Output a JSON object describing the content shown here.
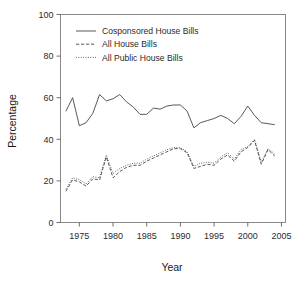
{
  "chart_data": {
    "type": "line",
    "title": "",
    "xlabel": "Year",
    "ylabel": "Percentage",
    "xlim": [
      1972.2,
      2005.6
    ],
    "ylim": [
      0,
      100
    ],
    "xticks": [
      1975,
      1980,
      1985,
      1990,
      1995,
      2000,
      2005
    ],
    "yticks": [
      0,
      20,
      40,
      60,
      80,
      100
    ],
    "grid": false,
    "legend_position": "upper-left-inside",
    "x": [
      1973,
      1974,
      1975,
      1976,
      1977,
      1978,
      1979,
      1980,
      1981,
      1982,
      1983,
      1984,
      1985,
      1986,
      1987,
      1988,
      1989,
      1990,
      1991,
      1992,
      1993,
      1994,
      1995,
      1996,
      1997,
      1998,
      1999,
      2000,
      2001,
      2002,
      2003,
      2004
    ],
    "series": [
      {
        "name": "Cosponsored House Bills",
        "style": "solid",
        "values": [
          53.5,
          60.0,
          46.5,
          48.0,
          52.5,
          61.5,
          58.5,
          59.5,
          61.5,
          58.0,
          55.5,
          52.0,
          52.0,
          55.0,
          54.5,
          56.0,
          56.5,
          56.5,
          53.5,
          45.5,
          48.0,
          49.0,
          50.0,
          51.5,
          50.0,
          47.5,
          51.0,
          56.0,
          51.5,
          48.0,
          47.5,
          47.0
        ]
      },
      {
        "name": "All House Bills",
        "style": "dashed",
        "values": [
          15.0,
          20.5,
          19.5,
          17.5,
          21.0,
          20.5,
          31.5,
          21.5,
          24.5,
          26.5,
          27.5,
          27.5,
          29.5,
          31.0,
          32.5,
          34.0,
          35.5,
          35.5,
          33.5,
          26.0,
          27.0,
          28.0,
          27.5,
          30.5,
          32.5,
          29.5,
          34.0,
          36.0,
          39.5,
          28.0,
          35.0,
          32.0
        ]
      },
      {
        "name": "All Public House Bills",
        "style": "dotted",
        "values": [
          16.0,
          21.5,
          20.5,
          18.5,
          22.0,
          21.5,
          32.5,
          23.5,
          26.0,
          27.5,
          28.5,
          28.5,
          30.5,
          32.0,
          33.5,
          35.0,
          36.0,
          36.0,
          34.0,
          27.0,
          28.5,
          29.0,
          28.5,
          31.5,
          33.5,
          30.5,
          35.0,
          36.5,
          40.0,
          29.0,
          35.5,
          33.0
        ]
      }
    ]
  },
  "legend": {
    "entries": [
      {
        "label": "Cosponsored House Bills",
        "style": "solid"
      },
      {
        "label": "All House Bills",
        "style": "dashed"
      },
      {
        "label": "All Public House Bills",
        "style": "dotted"
      }
    ]
  },
  "axes": {
    "y_title": "Percentage",
    "x_title": "Year",
    "y_tick_labels": [
      "0",
      "20",
      "40",
      "60",
      "80",
      "100"
    ],
    "x_tick_labels": [
      "1975",
      "1980",
      "1985",
      "1990",
      "1995",
      "2000",
      "2005"
    ]
  },
  "colors": {
    "line": "#3a3a3a",
    "axis": "#4d4d4d",
    "text": "#1a1a1a",
    "background": "#ffffff"
  }
}
